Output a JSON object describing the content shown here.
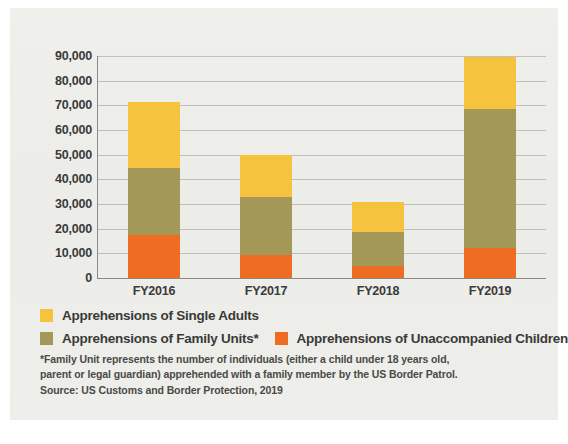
{
  "chart_data": {
    "type": "bar",
    "subtype": "stacked-bar",
    "title": "",
    "xlabel": "",
    "ylabel": "",
    "ylim": [
      0,
      90000
    ],
    "grid": true,
    "legend_position": "bottom",
    "categories": [
      "FY2016",
      "FY2017",
      "FY2018",
      "FY2019"
    ],
    "ytick_labels": [
      "90,000",
      "80,000",
      "70,000",
      "60,000",
      "50,000",
      "40,000",
      "30,000",
      "20,000",
      "10,000",
      "0"
    ],
    "ytick_values": [
      90000,
      80000,
      70000,
      60000,
      50000,
      40000,
      30000,
      20000,
      10000,
      0
    ],
    "series": [
      {
        "name": "Apprehensions of Unaccompanied Children",
        "color": "#ee6d22",
        "values": [
          17500,
          9500,
          5000,
          12000
        ]
      },
      {
        "name": "Apprehensions of Family Units*",
        "color": "#a39858",
        "values": [
          27000,
          23500,
          13500,
          56500
        ]
      },
      {
        "name": "Apprehensions of Single Adults",
        "color": "#f6c33e",
        "values": [
          27000,
          16800,
          12500,
          21000
        ]
      }
    ],
    "totals": [
      71500,
      49800,
      31000,
      89500
    ]
  },
  "legend": {
    "rows": [
      [
        {
          "label": "Apprehensions of Single Adults",
          "color": "#f6c33e",
          "swatch_name": "legend-swatch-single-adults"
        }
      ],
      [
        {
          "label": "Apprehensions of Family Units*",
          "color": "#a39858",
          "swatch_name": "legend-swatch-family-units"
        },
        {
          "label": "Apprehensions of Unaccompanied Children",
          "color": "#ee6d22",
          "swatch_name": "legend-swatch-unaccompanied-children"
        }
      ]
    ]
  },
  "notes": {
    "footnote_line_1": "*Family Unit represents the number of individuals (either a child under 18 years old,",
    "footnote_line_2": "parent or legal guardian) apprehended with a family member by the US Border Patrol.",
    "source": "Source: US Customs and Border Protection, 2019"
  },
  "colors": {
    "single_adults": "#f6c33e",
    "family_units": "#a39858",
    "unaccompanied_children": "#ee6d22",
    "background": "#eeeeea",
    "text": "#3a3a38",
    "gridline": "#9a9a94"
  }
}
